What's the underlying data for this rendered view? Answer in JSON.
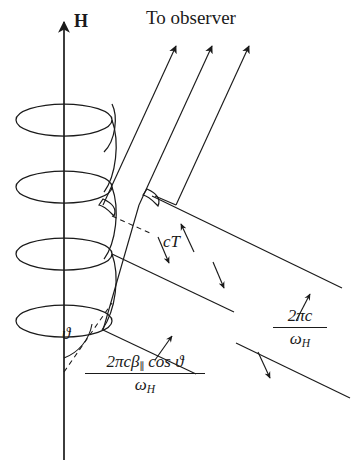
{
  "figure": {
    "title_note": "Helical charged-particle trajectory in magnetic field H with radiation wavefronts toward observer",
    "background_color": "#ffffff",
    "ink_color": "#1a1a1a"
  },
  "labels": {
    "observer": "To observer",
    "field_axis": "H",
    "angle": "ϑ",
    "light_path": "cT"
  },
  "formulas": {
    "wavelength_right": {
      "numerator": "2πc",
      "denominator": "ω",
      "denominator_subscript": "H",
      "full": "2πc / ω_H"
    },
    "pitch_left": {
      "numerator_lead": "2πcβ",
      "numerator_subscript": "∥",
      "numerator_tail": "cos ϑ",
      "denominator": "ω",
      "denominator_subscript": "H",
      "full": "2πcβ∥cos ϑ / ω_H"
    }
  },
  "geometry": {
    "axis": {
      "x": 64,
      "y_top": 18,
      "y_bottom": 460
    },
    "helix": {
      "turns": 4,
      "rx": 48,
      "ry": 16,
      "center_x": 64,
      "y_first": 120,
      "y_step": 67
    },
    "rays": {
      "count": 3,
      "angle_degrees": 63,
      "tips": [
        [
          175,
          42
        ],
        [
          211,
          42
        ],
        [
          249,
          42
        ]
      ]
    },
    "wavefronts": {
      "count": 2
    },
    "dimension_labels": [
      "cT",
      "2πc / ω_H",
      "2πcβ∥cos ϑ / ω_H"
    ]
  }
}
